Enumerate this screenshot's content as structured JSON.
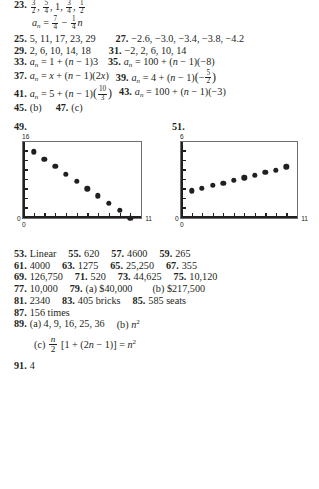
{
  "answers": {
    "a23": {
      "num": "23.",
      "seq": [
        "3/2",
        "5/4",
        "1",
        "3/4",
        "1/2"
      ],
      "formula_lead": "a_n =",
      "formula": "7/4 − (1/4)n"
    },
    "a25": {
      "num": "25.",
      "value": "5, 11, 17, 23, 29"
    },
    "a27": {
      "num": "27.",
      "value": "−2.6, −3.0, −3.4, −3.8, −4.2"
    },
    "a29": {
      "num": "29.",
      "value": "2, 6, 10, 14, 18"
    },
    "a31": {
      "num": "31.",
      "value": "−2, 2, 6, 10, 14"
    },
    "a33": {
      "num": "33.",
      "value": "a_n = 1 + (n − 1)3"
    },
    "a35": {
      "num": "35.",
      "value": "a_n = 100 + (n − 1)(−8)"
    },
    "a37": {
      "num": "37.",
      "value": "a_n = x + (n − 1)(2x)"
    },
    "a39": {
      "num": "39.",
      "value": "a_n = 4 + (n − 1)(−5/2)"
    },
    "a41": {
      "num": "41.",
      "value": "a_n = 5 + (n − 1)(10/3)"
    },
    "a43": {
      "num": "43.",
      "value": "a_n = 100 + (n − 1)(−3)"
    },
    "a45": {
      "num": "45.",
      "value": "(b)"
    },
    "a47": {
      "num": "47.",
      "value": "(c)"
    },
    "a49": {
      "num": "49."
    },
    "a51": {
      "num": "51."
    },
    "a53": {
      "num": "53.",
      "value": "Linear"
    },
    "a55": {
      "num": "55.",
      "value": "620"
    },
    "a57": {
      "num": "57.",
      "value": "4600"
    },
    "a59": {
      "num": "59.",
      "value": "265"
    },
    "a61": {
      "num": "61.",
      "value": "4000"
    },
    "a63": {
      "num": "63.",
      "value": "1275"
    },
    "a65": {
      "num": "65.",
      "value": "25,250"
    },
    "a67": {
      "num": "67.",
      "value": "355"
    },
    "a69": {
      "num": "69.",
      "value": "126,750"
    },
    "a71": {
      "num": "71.",
      "value": "520"
    },
    "a73": {
      "num": "73.",
      "value": "44,625"
    },
    "a75": {
      "num": "75.",
      "value": "10,120"
    },
    "a77": {
      "num": "77.",
      "value": "10,000"
    },
    "a79": {
      "num": "79.",
      "part_a": "(a) $40,000",
      "part_b": "(b) $217,500"
    },
    "a81": {
      "num": "81.",
      "value": "2340"
    },
    "a83": {
      "num": "83.",
      "value": "405 bricks"
    },
    "a85": {
      "num": "85.",
      "value": "585 seats"
    },
    "a87": {
      "num": "87.",
      "value": "156 times"
    },
    "a89": {
      "num": "89.",
      "part_a": "(a) 4, 9, 16, 25, 36",
      "part_b_lead": "(b)",
      "part_b_expr": "n",
      "part_b_exp": "2",
      "part_c_lead": "(c)",
      "part_c_frac_n": "n",
      "part_c_frac_d": "2",
      "part_c_body": "[1 + (2n − 1)] =",
      "part_c_result": "n",
      "part_c_result_exp": "2"
    },
    "a91": {
      "num": "91.",
      "value": "4"
    }
  },
  "symbols": {
    "a": "a",
    "n_sub": "n",
    "equals": "=",
    "n_italic": "n",
    "minus": "−",
    "plus": "+",
    "x_italic": "x",
    "lparen": "(",
    "rparen": ")",
    "one": "1",
    "three": "3",
    "four": "4",
    "five": "5",
    "seven": "7",
    "two": "2",
    "ten": "10",
    "hundred": "100",
    "neg8": "(−8)",
    "neg3": "(−3)",
    "two_x": "(2x)",
    "n_minus_1": "(n − 1)",
    "comma": ",",
    "one_lit": "1"
  },
  "chart_data": [
    {
      "type": "scatter",
      "title": "49.",
      "xlabel": "",
      "ylabel": "",
      "xlim": [
        0,
        11
      ],
      "ylim": [
        0,
        16
      ],
      "x_tick_labels": {
        "min": "0",
        "max": "11"
      },
      "y_tick_labels": {
        "min": "0",
        "max": "16"
      },
      "grid": false,
      "legend": "none",
      "x": [
        1,
        2,
        3,
        4,
        5,
        6,
        7,
        8,
        9,
        10
      ],
      "y": [
        14.0,
        12.4,
        10.9,
        9.3,
        7.8,
        6.2,
        4.7,
        3.1,
        1.6,
        0.0
      ]
    },
    {
      "type": "scatter",
      "title": "51.",
      "xlabel": "",
      "ylabel": "",
      "xlim": [
        0,
        11
      ],
      "ylim": [
        0,
        6
      ],
      "x_tick_labels": {
        "min": "0",
        "max": "11"
      },
      "y_tick_labels": {
        "min": "0",
        "max": "6"
      },
      "grid": false,
      "legend": "none",
      "x": [
        1,
        2,
        3,
        4,
        5,
        6,
        7,
        8,
        9,
        10
      ],
      "y": [
        2.15,
        2.35,
        2.6,
        2.75,
        3.0,
        3.2,
        3.4,
        3.6,
        3.8,
        4.05
      ]
    }
  ]
}
